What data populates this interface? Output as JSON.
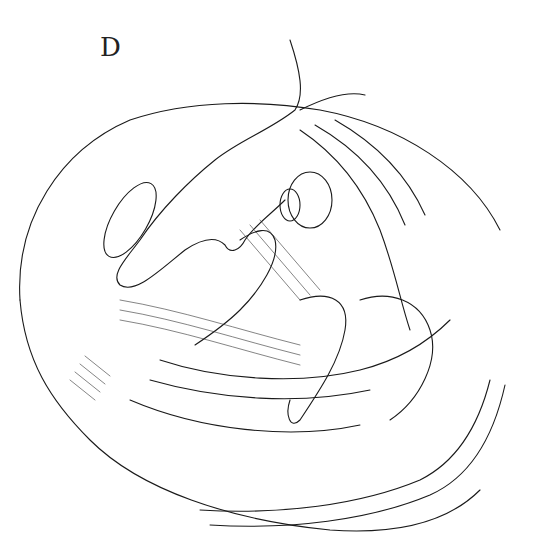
{
  "figure": {
    "panel_label": "D",
    "colors": {
      "ink": "#1a1a1a",
      "background": "#ffffff"
    }
  }
}
